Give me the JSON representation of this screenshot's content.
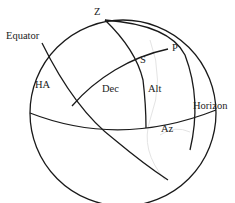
{
  "diagram": {
    "type": "celestial-sphere",
    "labels": {
      "zenith": "Z",
      "pole": "P",
      "star": "S",
      "equator": "Equator",
      "horizon": "Horizon",
      "hour_angle": "HA",
      "declination": "Dec",
      "altitude": "Alt",
      "azimuth": "Az"
    }
  }
}
